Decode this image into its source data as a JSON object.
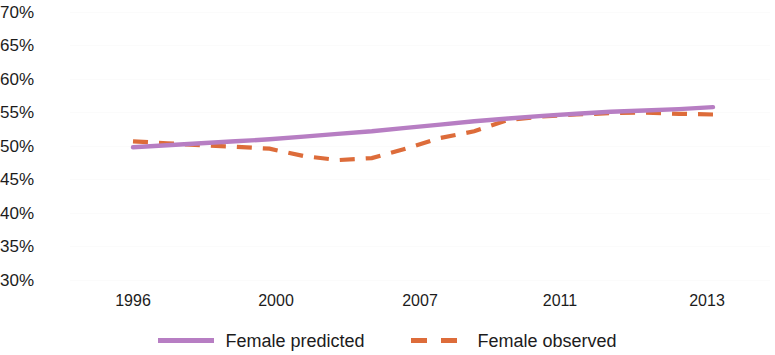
{
  "chart_data": {
    "type": "line",
    "title": "",
    "subtitle": "",
    "xlabel": "",
    "ylabel": "",
    "grid": true,
    "legend_position": "bottom-center",
    "x_tick_labels": [
      "1996",
      "2000",
      "2007",
      "2011",
      "2013"
    ],
    "y_tick_labels": [
      "70%",
      "65%",
      "60%",
      "55%",
      "50%",
      "45%",
      "40%",
      "35%",
      "30%"
    ],
    "y_tick_values": [
      70,
      65,
      60,
      55,
      50,
      45,
      40,
      35,
      30
    ],
    "ylim": [
      30,
      70
    ],
    "xlim": [
      1996,
      2013
    ],
    "x": [
      1996,
      1997,
      1998,
      1999,
      2000,
      2001,
      2002,
      2003,
      2004,
      2005,
      2006,
      2007,
      2008,
      2009,
      2010,
      2011,
      2012,
      2013
    ],
    "series": [
      {
        "name": "Female predicted",
        "style": "solid",
        "color": "#b77ec3",
        "values": [
          49.8,
          50.1,
          50.4,
          50.7,
          51.0,
          51.4,
          51.8,
          52.2,
          52.7,
          53.2,
          53.7,
          54.1,
          54.5,
          54.8,
          55.1,
          55.3,
          55.5,
          55.8
        ]
      },
      {
        "name": "Female observed",
        "style": "dashed",
        "color": "#dd6c3a",
        "values": [
          50.7,
          50.4,
          50.1,
          49.9,
          49.6,
          48.5,
          47.9,
          48.2,
          49.6,
          51.2,
          52.2,
          53.9,
          54.4,
          54.7,
          54.9,
          55.0,
          54.8,
          54.7
        ]
      }
    ],
    "legend": [
      {
        "label": "Female predicted",
        "style": "solid",
        "color": "#b77ec3"
      },
      {
        "label": "Female observed",
        "style": "dashed",
        "color": "#dd6c3a"
      }
    ]
  }
}
